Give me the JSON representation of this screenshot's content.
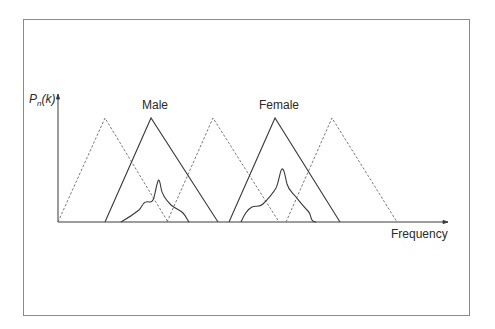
{
  "diagram": {
    "y_axis_label": {
      "main": "P",
      "sub": "n",
      "arg": "(k)"
    },
    "x_axis_label": "Frequency",
    "labels": {
      "male": "Male",
      "female": "Female"
    },
    "colors": {
      "line": "#3a3a3a",
      "dashed": "#6a6a6a",
      "frame": "#8a8a8a"
    },
    "filters": [
      {
        "style": "dashed",
        "left": 58,
        "peak": 105,
        "right": 168
      },
      {
        "style": "solid",
        "label": "Male",
        "left": 105,
        "peak": 151,
        "right": 218
      },
      {
        "style": "dashed",
        "left": 167,
        "peak": 213,
        "right": 279
      },
      {
        "style": "solid",
        "label": "Female",
        "left": 229,
        "peak": 275,
        "right": 340
      },
      {
        "style": "dashed",
        "left": 286,
        "peak": 332,
        "right": 397
      }
    ],
    "spectra": [
      {
        "name": "male-spectrum",
        "peak_x": 158
      },
      {
        "name": "female-spectrum",
        "peak_x": 282
      }
    ]
  }
}
